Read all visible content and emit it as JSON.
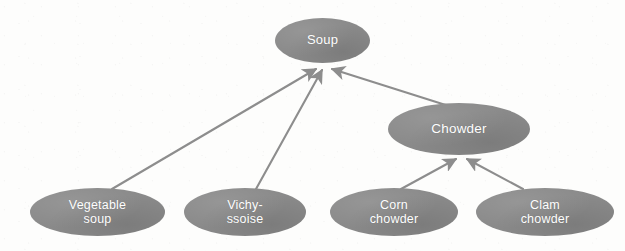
{
  "diagram": {
    "kind": "is-a-hierarchy",
    "title_text": "",
    "background_color": "#fdfdfc",
    "node_fill_color": "#8a8a8a",
    "node_text_color": "#ffffff",
    "edge_color": "#8d8d8d",
    "nodes": [
      {
        "id": "soup",
        "label": "Soup",
        "level": 0,
        "center_x": 322,
        "center_y": 40,
        "width": 95,
        "height": 45
      },
      {
        "id": "chowder",
        "label": "Chowder",
        "level": 1,
        "center_x": 459,
        "center_y": 129,
        "width": 142,
        "height": 52
      },
      {
        "id": "vegetable-soup",
        "label": "Vegetable\nsoup",
        "level": 2,
        "center_x": 97,
        "center_y": 212,
        "width": 135,
        "height": 48
      },
      {
        "id": "vichyssoise",
        "label": "Vichy-\nssoise",
        "level": 2,
        "center_x": 245,
        "center_y": 212,
        "width": 122,
        "height": 48
      },
      {
        "id": "corn-chowder",
        "label": "Corn\nchowder",
        "level": 2,
        "center_x": 394,
        "center_y": 212,
        "width": 128,
        "height": 48
      },
      {
        "id": "clam-chowder",
        "label": "Clam\nchowder",
        "level": 2,
        "center_x": 545,
        "center_y": 212,
        "width": 138,
        "height": 48
      }
    ],
    "edges": [
      {
        "id": "vegetable-soup-to-soup",
        "from": "vegetable-soup",
        "to": "soup",
        "x1": 112,
        "y1": 189,
        "x2": 316,
        "y2": 69,
        "arrow": "to"
      },
      {
        "id": "vichyssoise-to-soup",
        "from": "vichyssoise",
        "to": "soup",
        "x1": 256,
        "y1": 189,
        "x2": 322,
        "y2": 70,
        "arrow": "to"
      },
      {
        "id": "chowder-to-soup",
        "from": "chowder",
        "to": "soup",
        "x1": 452,
        "y1": 107,
        "x2": 332,
        "y2": 69,
        "arrow": "to"
      },
      {
        "id": "corn-chowder-to-chowder",
        "from": "corn-chowder",
        "to": "chowder",
        "x1": 401,
        "y1": 189,
        "x2": 456,
        "y2": 159,
        "arrow": "to"
      },
      {
        "id": "clam-chowder-to-chowder",
        "from": "clam-chowder",
        "to": "chowder",
        "x1": 523,
        "y1": 189,
        "x2": 467,
        "y2": 159,
        "arrow": "to"
      }
    ]
  }
}
